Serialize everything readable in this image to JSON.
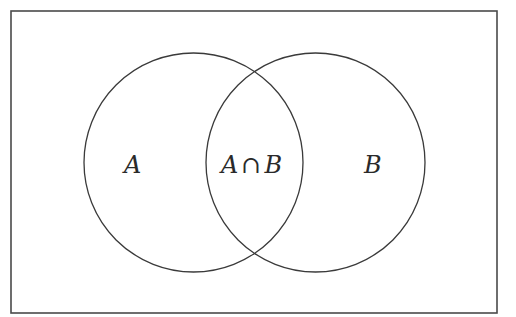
{
  "diagram": {
    "type": "venn",
    "universe": {
      "x": 11,
      "y": 11,
      "width": 486,
      "height": 302
    },
    "sets": [
      {
        "name": "A",
        "cx": 193.5,
        "cy": 162.5,
        "r": 109.5
      },
      {
        "name": "B",
        "cx": 315.5,
        "cy": 162.5,
        "r": 109.5
      }
    ],
    "labels": {
      "a_only": "A",
      "intersection_left": "A",
      "intersection_op": "∩",
      "intersection_right": "B",
      "b_only": "B"
    },
    "colors": {
      "stroke": "#3a3a3a",
      "background": "#ffffff",
      "text": "#2a2a2a"
    }
  }
}
